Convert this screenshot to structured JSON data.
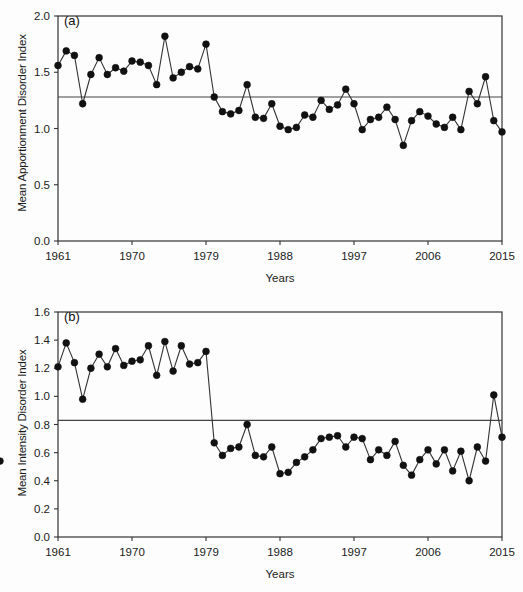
{
  "figure": {
    "panels": [
      {
        "id": "a",
        "tag": "(a)",
        "ylabel": "Mean Apportionment Disorder Index",
        "xlabel": "Years"
      },
      {
        "id": "b",
        "tag": "(b)",
        "ylabel": "Mean Intensity Disorder Index",
        "xlabel": "Years"
      }
    ],
    "colors": {
      "marker": "#111111",
      "line": "#333333",
      "mean_line": "#444444",
      "axis": "#333333",
      "background": "#fdfdfd"
    }
  },
  "chart_data": [
    {
      "type": "line",
      "id": "a",
      "title": "(a)",
      "xlabel": "Years",
      "ylabel": "Mean Apportionment Disorder Index",
      "xlim": [
        1961,
        2015
      ],
      "ylim": [
        0.0,
        2.0
      ],
      "yticks": [
        0.0,
        0.5,
        1.0,
        1.5,
        2.0
      ],
      "ytick_labels": [
        "0.0",
        "0.5",
        "1.0",
        "1.5",
        "2.0"
      ],
      "xticks": [
        1961,
        1970,
        1979,
        1988,
        1997,
        2006,
        2015
      ],
      "xtick_labels": [
        "1961",
        "1970",
        "1979",
        "1988",
        "1997",
        "2006",
        "2015"
      ],
      "grid": false,
      "legend": null,
      "marker": "filled-circle",
      "reference_line": {
        "orientation": "horizontal",
        "value": 1.28,
        "label": "mean"
      },
      "x": [
        1961,
        1962,
        1963,
        1964,
        1965,
        1966,
        1967,
        1968,
        1969,
        1970,
        1971,
        1972,
        1973,
        1974,
        1975,
        1976,
        1977,
        1978,
        1979,
        1980,
        1981,
        1982,
        1983,
        1984,
        1985,
        1986,
        1987,
        1988,
        1989,
        1990,
        1991,
        1992,
        1993,
        1994,
        1995,
        1996,
        1997,
        1998,
        1999,
        2000,
        2001,
        2002,
        2003,
        2004,
        2005,
        2006,
        2007,
        2008,
        2009,
        2010,
        2011,
        2012,
        2013,
        2014,
        2015
      ],
      "values": [
        1.56,
        1.69,
        1.65,
        1.22,
        1.48,
        1.63,
        1.48,
        1.54,
        1.51,
        1.6,
        1.59,
        1.56,
        1.39,
        1.82,
        1.45,
        1.5,
        1.55,
        1.53,
        1.75,
        1.28,
        1.15,
        1.13,
        1.16,
        1.39,
        1.1,
        1.09,
        1.22,
        1.02,
        0.99,
        1.01,
        1.12,
        1.1,
        1.25,
        1.17,
        1.21,
        1.35,
        1.22,
        0.99,
        1.08,
        1.1,
        1.19,
        1.08,
        0.85,
        1.07,
        1.15,
        1.11,
        1.04,
        1.01,
        1.1,
        0.99,
        1.33,
        1.22,
        1.46,
        1.07,
        0.97
      ]
    },
    {
      "type": "line",
      "id": "b",
      "title": "(b)",
      "xlabel": "Years",
      "ylabel": "Mean Intensity Disorder Index",
      "xlim": [
        1961,
        2015
      ],
      "ylim": [
        0.0,
        1.6
      ],
      "yticks": [
        0.0,
        0.2,
        0.4,
        0.6,
        0.8,
        1.0,
        1.2,
        1.4,
        1.6
      ],
      "ytick_labels": [
        "0.0",
        "0.2",
        "0.4",
        "0.6",
        "0.8",
        "1.0",
        "1.2",
        "1.4",
        "1.6"
      ],
      "xticks": [
        1961,
        1970,
        1979,
        1988,
        1997,
        2006,
        2015
      ],
      "xtick_labels": [
        "1961",
        "1970",
        "1979",
        "1988",
        "1997",
        "2006",
        "2015"
      ],
      "grid": false,
      "legend": null,
      "marker": "filled-circle",
      "reference_line": {
        "orientation": "horizontal",
        "value": 0.83,
        "label": "mean"
      },
      "x": [
        1961,
        1962,
        1963,
        1964,
        1965,
        1966,
        1967,
        1968,
        1969,
        1970,
        1971,
        1972,
        1973,
        1974,
        1975,
        1976,
        1977,
        1978,
        1979,
        1980,
        1981,
        1982,
        1983,
        1984,
        1985,
        1986,
        1987,
        1988,
        1989,
        1990,
        1991,
        1992,
        1993,
        1994,
        1995,
        1996,
        1997,
        1998,
        1999,
        2000,
        2001,
        2002,
        2003,
        2004,
        2005,
        2006,
        2007,
        2008,
        2009,
        2010,
        2011,
        2012,
        2013,
        2014,
        2015
      ],
      "values": [
        1.21,
        1.38,
        1.24,
        0.98,
        1.2,
        1.3,
        1.21,
        1.34,
        1.22,
        1.25,
        1.26,
        1.36,
        1.15,
        1.39,
        1.18,
        1.36,
        1.23,
        1.24,
        1.32,
        0.67,
        0.58,
        0.63,
        0.64,
        0.8,
        0.58,
        0.57,
        0.64,
        0.45,
        0.46,
        0.53,
        0.57,
        0.62,
        0.7,
        0.71,
        0.72,
        0.64,
        0.71,
        0.7,
        0.55,
        0.62,
        0.58,
        0.68,
        0.51,
        0.44,
        0.55,
        0.62,
        0.52,
        0.62,
        0.47,
        0.61,
        0.4,
        0.64,
        0.54,
        1.01,
        0.71,
        0.54
      ]
    }
  ]
}
